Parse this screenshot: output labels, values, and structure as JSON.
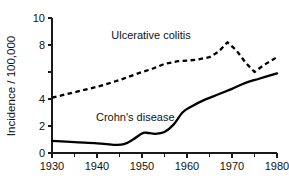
{
  "chart_data": {
    "type": "line",
    "title": "",
    "xlabel": "",
    "ylabel": "Incidence / 100,000",
    "xlim": [
      1930,
      1980
    ],
    "ylim": [
      0,
      10
    ],
    "grid": false,
    "legend_position": "inline-annotation",
    "x_ticks": [
      1930,
      1940,
      1950,
      1960,
      1970,
      1980
    ],
    "x_tick_labels": [
      "1930",
      "1940",
      "1950",
      "1960",
      "1970",
      "1980"
    ],
    "x_minor_ticks": [
      1935,
      1945,
      1955,
      1965,
      1975
    ],
    "y_ticks": [
      0,
      2,
      4,
      6,
      8,
      10
    ],
    "y_tick_labels": [
      "0",
      "2",
      "4",
      "",
      "8",
      "10"
    ],
    "series": [
      {
        "name": "Ulcerative colitis",
        "style": "dashed",
        "color": "#000000",
        "label_x": 1952,
        "label_y": 8.45,
        "x": [
          1930,
          1935,
          1940,
          1945,
          1950,
          1952,
          1955,
          1958,
          1960,
          1962,
          1965,
          1967,
          1969,
          1971,
          1973,
          1975,
          1977,
          1980
        ],
        "values": [
          4.1,
          4.5,
          4.9,
          5.4,
          6.0,
          6.2,
          6.6,
          6.8,
          6.85,
          6.9,
          7.1,
          7.5,
          8.2,
          7.6,
          6.7,
          6.0,
          6.5,
          7.1
        ]
      },
      {
        "name": "Crohn's disease",
        "style": "solid",
        "color": "#000000",
        "label_x": 1948.5,
        "label_y": 2.35,
        "x": [
          1930,
          1935,
          1940,
          1944,
          1946,
          1948,
          1950,
          1951,
          1953,
          1955,
          1957,
          1959,
          1961,
          1964,
          1967,
          1970,
          1973,
          1976,
          1980
        ],
        "values": [
          0.9,
          0.8,
          0.72,
          0.6,
          0.65,
          1.0,
          1.45,
          1.5,
          1.42,
          1.55,
          2.1,
          3.0,
          3.45,
          3.95,
          4.35,
          4.75,
          5.2,
          5.5,
          5.9
        ]
      }
    ]
  }
}
